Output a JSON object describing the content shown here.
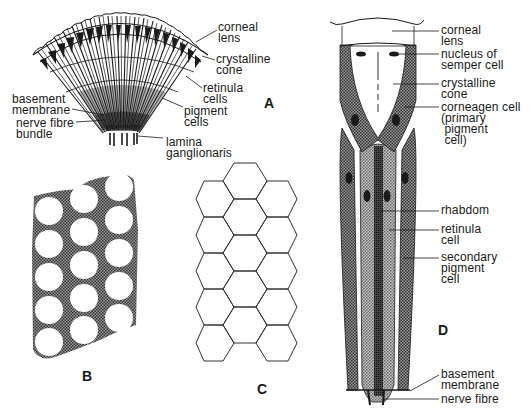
{
  "figure": {
    "panels": [
      {
        "id": "A",
        "letter": "A",
        "description": "Section through compound eye showing radiating ommatidia"
      },
      {
        "id": "B",
        "letter": "B",
        "description": "Cross-section pattern: circles in pigment matrix"
      },
      {
        "id": "C",
        "letter": "C",
        "description": "Hexagonal facet pattern"
      },
      {
        "id": "D",
        "letter": "D",
        "description": "Single ommatidium longitudinal section"
      }
    ],
    "panel_a": {
      "letter": "A",
      "labels": {
        "corneal_lens": "corneal\nlens",
        "crystalline_cone": "crystalline\ncone",
        "retinula_cells": "retinula\ncells",
        "pigment_cells": "pigment\ncells",
        "basement_membrane": "basement\nmembrane",
        "nerve_fibre_bundle": "nerve fibre\nbundle",
        "lamina_ganglionaris": "lamina\nganglionaris"
      }
    },
    "panel_b": {
      "letter": "B"
    },
    "panel_c": {
      "letter": "C"
    },
    "panel_d": {
      "letter": "D",
      "labels": {
        "corneal_lens": "corneal\nlens",
        "nucleus_semper": "nucleus of\nsemper cell",
        "crystalline_cone": "crystalline\ncone",
        "corneagen_cell": "corneagen cell\n(primary\n pigment\n cell)",
        "rhabdom": "rhabdom",
        "retinula_cell": "retinula\ncell",
        "secondary_pigment": "secondary\npigment\ncell",
        "basement_membrane": "basement\nmembrane",
        "nerve_fibre": "nerve fibre"
      }
    },
    "colors": {
      "ink": "#1a1a1a",
      "stipple_dark": "#555555",
      "stipple_mid": "#8a8a8a",
      "rhabdom": "#2a2a2a",
      "background": "#ffffff"
    }
  }
}
